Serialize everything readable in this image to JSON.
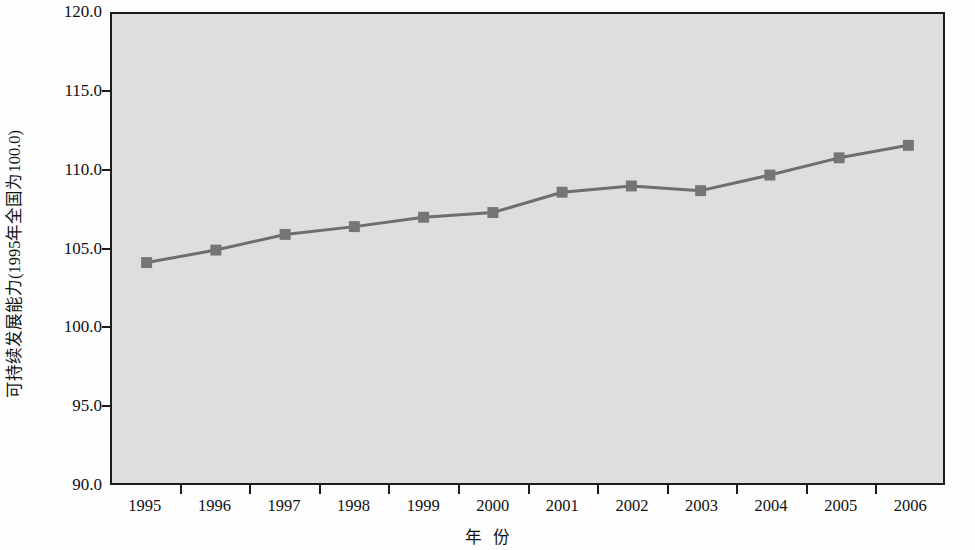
{
  "chart_data": {
    "type": "line",
    "title": "",
    "subtitle": "",
    "xlabel": "年  份",
    "xlabel_parts": [
      "年",
      "份"
    ],
    "ylabel": "可持续发展能力(1995年全国为100.0)",
    "categories": [
      "1995",
      "1996",
      "1997",
      "1998",
      "1999",
      "2000",
      "2001",
      "2002",
      "2003",
      "2004",
      "2005",
      "2006"
    ],
    "x": [
      1995,
      1996,
      1997,
      1998,
      1999,
      2000,
      2001,
      2002,
      2003,
      2004,
      2005,
      2006
    ],
    "values": [
      104.1,
      104.9,
      105.9,
      106.4,
      107.0,
      107.3,
      108.6,
      109.0,
      108.7,
      109.7,
      110.8,
      111.6
    ],
    "series": [
      {
        "name": "可持续发展能力",
        "values": [
          104.1,
          104.9,
          105.9,
          106.4,
          107.0,
          107.3,
          108.6,
          109.0,
          108.7,
          109.7,
          110.8,
          111.6
        ]
      }
    ],
    "ylim": [
      90.0,
      120.0
    ],
    "ytick_labels": [
      "120.0",
      "115.0",
      "110.0",
      "105.0",
      "100.0",
      "95.0",
      "90.0"
    ],
    "ytick_values": [
      120.0,
      115.0,
      110.0,
      105.0,
      100.0,
      95.0,
      90.0
    ],
    "grid": false,
    "legend": false,
    "legend_position": "none",
    "marker": "square",
    "colors": {
      "line": "#6e6e6e",
      "marker": "#757575",
      "plot_background": "#dedede",
      "axis": "#1b1b1b",
      "text": "#111111",
      "figure_background": "#fdfdfd"
    }
  }
}
